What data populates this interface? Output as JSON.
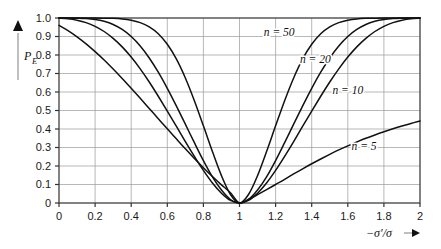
{
  "chart_data": {
    "type": "line",
    "title": "",
    "subtitle": "",
    "xlabel": "−σ′/σ",
    "ylabel": "P",
    "ylabel_sub": "E",
    "xlim": [
      0,
      2
    ],
    "ylim": [
      0,
      1.0
    ],
    "grid": true,
    "legend_position": "inline-annotations",
    "xticks": [
      "0",
      "0.2",
      "0.4",
      "0.6",
      "0.8",
      "1",
      "1.2",
      "1.4",
      "1.6",
      "1.8",
      "2"
    ],
    "xtick_values": [
      0,
      0.2,
      0.4,
      0.6,
      0.8,
      1.0,
      1.2,
      1.4,
      1.6,
      1.8,
      2.0
    ],
    "yticks": [
      "0",
      "0.1",
      "0.2",
      "0.3",
      "0.4",
      "0.5",
      "0.6",
      "0.7",
      "0.8",
      "0.9",
      "1.0"
    ],
    "ytick_values": [
      0,
      0.1,
      0.2,
      0.3,
      0.4,
      0.5,
      0.6,
      0.7,
      0.8,
      0.9,
      1.0
    ],
    "x": [
      0,
      0.05,
      0.1,
      0.15,
      0.2,
      0.25,
      0.3,
      0.35,
      0.4,
      0.45,
      0.5,
      0.55,
      0.6,
      0.65,
      0.7,
      0.75,
      0.8,
      0.85,
      0.9,
      0.95,
      1.0,
      1.05,
      1.1,
      1.15,
      1.2,
      1.25,
      1.3,
      1.35,
      1.4,
      1.45,
      1.5,
      1.55,
      1.6,
      1.65,
      1.7,
      1.75,
      1.8,
      1.85,
      1.9,
      1.95,
      2.0
    ],
    "series": [
      {
        "name": "n = 50",
        "label": "n = 50",
        "n": 50,
        "color": "#111111",
        "label_x": 1.22,
        "label_y": 0.905,
        "values": [
          1.0,
          1.0,
          1.0,
          1.0,
          1.0,
          0.999,
          0.998,
          0.995,
          0.988,
          0.975,
          0.952,
          0.915,
          0.858,
          0.779,
          0.676,
          0.553,
          0.417,
          0.278,
          0.148,
          0.046,
          0.0,
          0.046,
          0.148,
          0.278,
          0.417,
          0.553,
          0.676,
          0.779,
          0.858,
          0.915,
          0.952,
          0.975,
          0.988,
          0.995,
          0.998,
          0.999,
          1.0,
          1.0,
          1.0,
          1.0,
          1.0
        ]
      },
      {
        "name": "n = 20",
        "label": "n = 20",
        "n": 20,
        "color": "#111111",
        "label_x": 1.42,
        "label_y": 0.755,
        "values": [
          1.0,
          1.0,
          0.999,
          0.997,
          0.992,
          0.982,
          0.965,
          0.938,
          0.9,
          0.849,
          0.784,
          0.707,
          0.62,
          0.525,
          0.426,
          0.326,
          0.229,
          0.141,
          0.07,
          0.019,
          0.0,
          0.019,
          0.07,
          0.141,
          0.229,
          0.326,
          0.426,
          0.525,
          0.62,
          0.707,
          0.784,
          0.849,
          0.9,
          0.938,
          0.965,
          0.982,
          0.992,
          0.997,
          0.999,
          1.0,
          1.0
        ]
      },
      {
        "name": "n = 10",
        "label": "n = 10",
        "n": 10,
        "color": "#111111",
        "label_x": 1.6,
        "label_y": 0.59,
        "values": [
          0.999,
          0.996,
          0.988,
          0.975,
          0.955,
          0.927,
          0.89,
          0.844,
          0.789,
          0.725,
          0.654,
          0.577,
          0.497,
          0.415,
          0.332,
          0.252,
          0.176,
          0.108,
          0.053,
          0.014,
          0.0,
          0.014,
          0.053,
          0.108,
          0.176,
          0.252,
          0.332,
          0.415,
          0.497,
          0.577,
          0.654,
          0.725,
          0.789,
          0.844,
          0.89,
          0.927,
          0.955,
          0.975,
          0.988,
          0.996,
          0.999
        ]
      },
      {
        "name": "n = 5",
        "label": "n = 5",
        "n": 5,
        "color": "#111111",
        "label_x": 1.69,
        "label_y": 0.285,
        "values": [
          0.96,
          0.932,
          0.898,
          0.86,
          0.818,
          0.773,
          0.724,
          0.673,
          0.62,
          0.566,
          0.511,
          0.456,
          0.401,
          0.347,
          0.293,
          0.241,
          0.191,
          0.143,
          0.098,
          0.055,
          0.0,
          0.02,
          0.045,
          0.072,
          0.1,
          0.128,
          0.157,
          0.185,
          0.212,
          0.238,
          0.263,
          0.287,
          0.309,
          0.33,
          0.35,
          0.368,
          0.385,
          0.401,
          0.416,
          0.43,
          0.443
        ]
      }
    ]
  }
}
